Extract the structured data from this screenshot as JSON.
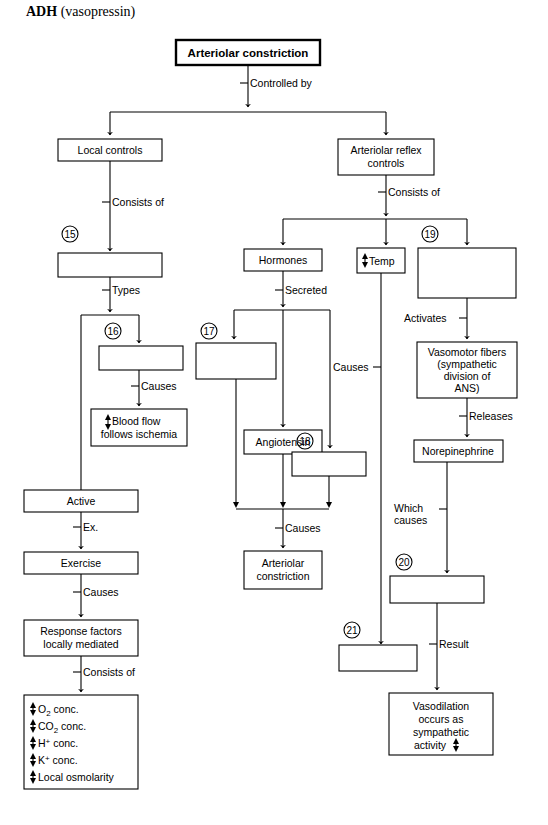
{
  "header": {
    "title_bold": "ADH",
    "title_rest": " (vasopressin)"
  },
  "diagram": {
    "type": "flowchart",
    "topic": "Control of Arteriolar constriction",
    "nodes": {
      "root": "Arteriolar constriction",
      "local_controls": "Local controls",
      "arteriolar_reflex_controls_l1": "Arteriolar reflex",
      "arteriolar_reflex_controls_l2": "controls",
      "blank_15": "",
      "blank_16": "",
      "blank_17": "",
      "blank_18": "",
      "blank_19": "",
      "blank_20": "",
      "blank_21": "",
      "blood_flow_l1": "Blood flow",
      "blood_flow_l2": "follows ischemia",
      "blood_flow_arrow": "updown-arrow",
      "active": "Active",
      "exercise": "Exercise",
      "response_factors_l1": "Response factors",
      "response_factors_l2": "locally mediated",
      "hormones": "Hormones",
      "angiotensin": "Angiotensin",
      "arteriolar_constriction_l1": "Arteriolar",
      "arteriolar_constriction_l2": "constriction",
      "temp": "Temp",
      "temp_arrow": "updown-arrow",
      "vasomotor_l1": "Vasomotor fibers",
      "vasomotor_l2": "(sympathetic",
      "vasomotor_l3": "division of",
      "vasomotor_l4": "ANS)",
      "norepinephrine": "Norepinephrine",
      "vasodilation_l1": "Vasodilation",
      "vasodilation_l2": "occurs as",
      "vasodilation_l3": "sympathetic",
      "vasodilation_l4": "activity",
      "vasodilation_arrow": "updown-arrow"
    },
    "local_factors_list": [
      {
        "arrow": "updown-arrow",
        "text": "O",
        "sub": "2",
        "rest": " conc."
      },
      {
        "arrow": "updown-arrow",
        "text": "CO",
        "sub": "2",
        "rest": " conc."
      },
      {
        "arrow": "updown-arrow",
        "text": "H",
        "sup": "+",
        "rest": " conc."
      },
      {
        "arrow": "updown-arrow",
        "text": "K",
        "sup": "+",
        "rest": " conc."
      },
      {
        "arrow": "updown-arrow",
        "text": "Local osmolarity",
        "sub": "",
        "rest": ""
      }
    ],
    "edge_labels": {
      "controlled_by": "Controlled by",
      "consists_of_left": "Consists of",
      "consists_of_right": "Consists of",
      "types": "Types",
      "causes_16": "Causes",
      "ex": "Ex.",
      "causes_exercise": "Causes",
      "consists_of_factors": "Consists of",
      "secreted": "Secreted",
      "causes_hormone_group": "Causes",
      "causes_temp": "Causes",
      "activates": "Activates",
      "releases": "Releases",
      "which_causes_l1": "Which",
      "which_causes_l2": "causes",
      "result": "Result"
    },
    "blank_numbers": [
      "15",
      "16",
      "17",
      "18",
      "19",
      "20",
      "21"
    ],
    "colors": {
      "stroke": "#000000",
      "fill": "#ffffff",
      "text": "#000000"
    }
  }
}
